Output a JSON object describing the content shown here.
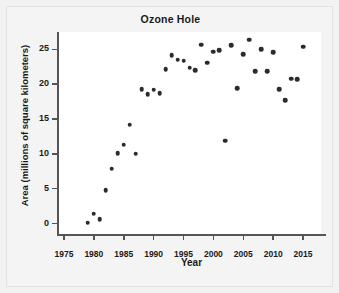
{
  "chart_data": {
    "type": "scatter",
    "title": "Ozone Hole",
    "xlabel": "Year",
    "ylabel": "Area (millions of square kilometers)",
    "xlim": [
      1974,
      2018
    ],
    "ylim": [
      -1.5,
      27.5
    ],
    "xticks": [
      1975,
      1980,
      1985,
      1990,
      1995,
      2000,
      2005,
      2010,
      2015
    ],
    "yticks": [
      0,
      5,
      10,
      15,
      20,
      25
    ],
    "grid": false,
    "legend": null,
    "marker_color": "#2b2b2b",
    "x": [
      1979,
      1980,
      1981,
      1982,
      1983,
      1984,
      1985,
      1986,
      1987,
      1988,
      1989,
      1990,
      1991,
      1992,
      1993,
      1994,
      1995,
      1996,
      1997,
      1998,
      1999,
      2000,
      2001,
      2002,
      2003,
      2004,
      2005,
      2006,
      2007,
      2008,
      2009,
      2010,
      2011,
      2012,
      2013,
      2014,
      2015
    ],
    "y": [
      0.1,
      1.4,
      0.6,
      4.8,
      7.9,
      10.1,
      11.3,
      10.0,
      19.3,
      18.6,
      19.2,
      18.7,
      22.2,
      24.2,
      23.5,
      22.4,
      22.0,
      25.7,
      23.1,
      24.7,
      24.9,
      25.6,
      19.4,
      11.9,
      24.3,
      26.4,
      21.9,
      25.0,
      21.9,
      24.6,
      19.3,
      17.7,
      20.8,
      20.7,
      25.4,
      22.0,
      21.0
    ],
    "points": [
      {
        "x": 1979,
        "y": 0.1
      },
      {
        "x": 1980,
        "y": 1.4
      },
      {
        "x": 1981,
        "y": 0.6
      },
      {
        "x": 1982,
        "y": 4.8
      },
      {
        "x": 1983,
        "y": 7.9
      },
      {
        "x": 1984,
        "y": 10.1
      },
      {
        "x": 1985,
        "y": 11.3
      },
      {
        "x": 1986,
        "y": 14.2
      },
      {
        "x": 1987,
        "y": 10.0
      },
      {
        "x": 1988,
        "y": 19.3
      },
      {
        "x": 1989,
        "y": 18.6
      },
      {
        "x": 1990,
        "y": 19.2
      },
      {
        "x": 1991,
        "y": 18.7
      },
      {
        "x": 1992,
        "y": 22.2
      },
      {
        "x": 1993,
        "y": 24.2
      },
      {
        "x": 1994,
        "y": 23.5
      },
      {
        "x": 1995,
        "y": 23.4
      },
      {
        "x": 1996,
        "y": 22.4
      },
      {
        "x": 1997,
        "y": 22.0
      },
      {
        "x": 1998,
        "y": 25.7
      },
      {
        "x": 1999,
        "y": 23.1
      },
      {
        "x": 2000,
        "y": 24.7
      },
      {
        "x": 2001,
        "y": 24.9
      },
      {
        "x": 2002,
        "y": 11.9
      },
      {
        "x": 2003,
        "y": 25.6
      },
      {
        "x": 2004,
        "y": 19.4
      },
      {
        "x": 2005,
        "y": 24.3
      },
      {
        "x": 2006,
        "y": 26.4
      },
      {
        "x": 2007,
        "y": 21.9
      },
      {
        "x": 2008,
        "y": 25.0
      },
      {
        "x": 2009,
        "y": 21.9
      },
      {
        "x": 2010,
        "y": 24.6
      },
      {
        "x": 2011,
        "y": 19.3
      },
      {
        "x": 2012,
        "y": 17.7
      },
      {
        "x": 2013,
        "y": 20.8
      },
      {
        "x": 2014,
        "y": 20.7
      },
      {
        "x": 2015,
        "y": 25.4
      }
    ]
  }
}
